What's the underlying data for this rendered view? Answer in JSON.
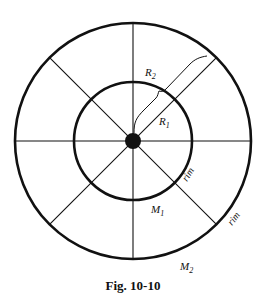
{
  "figure": {
    "caption": "Fig. 10-10",
    "center": {
      "x": 133,
      "y": 141
    },
    "outer_radius": 118,
    "inner_radius": 59,
    "hub_radius": 8,
    "spoke_angles_deg": [
      0,
      45,
      90,
      135,
      180,
      225,
      270,
      315
    ],
    "labels": {
      "R2": {
        "main": "R",
        "sub": "2"
      },
      "R1": {
        "main": "R",
        "sub": "1"
      },
      "M1": {
        "main": "M",
        "sub": "1"
      },
      "M2": {
        "main": "M",
        "sub": "2"
      },
      "rim_inner": "rim",
      "rim_outer": "rim"
    },
    "colors": {
      "stroke": "#111111",
      "background": "#ffffff"
    }
  }
}
